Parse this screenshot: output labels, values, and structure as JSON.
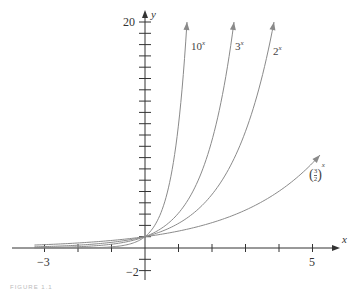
{
  "chart_data": {
    "type": "line",
    "title": "",
    "xlabel": "x",
    "ylabel": "y",
    "xlim": [
      -3.2,
      5.6
    ],
    "ylim": [
      -2,
      20
    ],
    "x_tick_labels": [
      "-3",
      "5"
    ],
    "y_tick_labels": [
      "20",
      "-2"
    ],
    "x_ticks": [
      -3,
      -2,
      -1,
      1,
      2,
      3,
      4,
      5
    ],
    "y_ticks": [
      -2,
      -1,
      1,
      2,
      3,
      4,
      5,
      6,
      7,
      8,
      9,
      10,
      11,
      12,
      13,
      14,
      15,
      16,
      17,
      18,
      19,
      20
    ],
    "grid": false,
    "legend": "inline labels",
    "series": [
      {
        "name": "10^x",
        "base": 10,
        "label_base": "10",
        "label_exp": "x"
      },
      {
        "name": "3^x",
        "base": 3,
        "label_base": "3",
        "label_exp": "x"
      },
      {
        "name": "2^x",
        "base": 2,
        "label_base": "2",
        "label_exp": "x"
      },
      {
        "name": "(3/2)^x",
        "base": 1.5,
        "label_base": "(3/2)",
        "label_exp": "x"
      }
    ],
    "annotations": [
      "All curves pass through (0, 1)"
    ],
    "colors": {
      "axis": "#333333",
      "curve": "#8a8a8a"
    }
  },
  "labels": {
    "x_axis": "x",
    "y_axis": "y",
    "tick_neg3": "−3",
    "tick_5": "5",
    "tick_20": "20",
    "tick_neg2": "−2",
    "c10_base": "10",
    "c3_base": "3",
    "c2_base": "2",
    "frac_num": "3",
    "frac_den": "2",
    "exp": "x"
  },
  "caption": "FIGURE 1.1"
}
